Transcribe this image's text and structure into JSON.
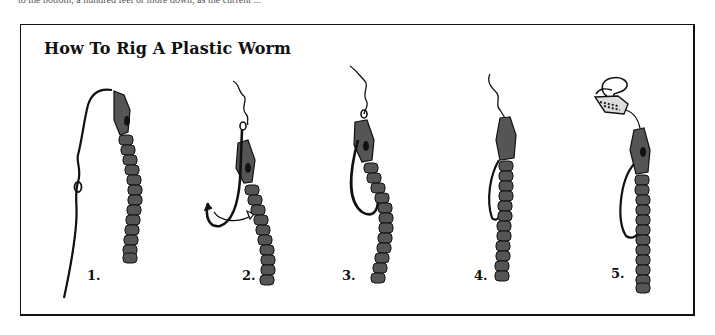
{
  "page": {
    "top_text": "to the bottom, a hundred feet or more down, as the current ..."
  },
  "figure": {
    "title": "How To Rig A Plastic Worm",
    "colors": {
      "frame": "#111111",
      "worm_body": "#555555",
      "outline": "#111111",
      "background": "#ffffff"
    },
    "steps": [
      {
        "label": "1.",
        "description": "line tied to worm head, knot on line"
      },
      {
        "label": "2.",
        "description": "hook inserted into head of worm, arrow showing hook rotation"
      },
      {
        "label": "3.",
        "description": "hook pulled through, eye embedded in worm head, point exposed"
      },
      {
        "label": "4.",
        "description": "hook point buried back in worm body (Texas rig)"
      },
      {
        "label": "5.",
        "description": "rig with slip sinker on line above worm"
      }
    ]
  }
}
